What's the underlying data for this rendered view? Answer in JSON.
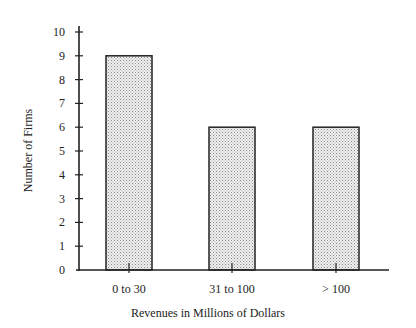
{
  "chart_data": {
    "type": "bar",
    "title": "",
    "xlabel": "Revenues in Millions of Dollars",
    "ylabel": "Number of Firms",
    "categories": [
      "0 to 30",
      "31 to 100",
      "> 100"
    ],
    "values": [
      9,
      6,
      6
    ],
    "ylim": [
      0,
      10
    ],
    "yticks": [
      0,
      1,
      2,
      3,
      4,
      5,
      6,
      7,
      8,
      9,
      10
    ],
    "grid": false,
    "legend": null,
    "bar_fill": "stippled light gray",
    "bar_edge_color": "#222222"
  }
}
